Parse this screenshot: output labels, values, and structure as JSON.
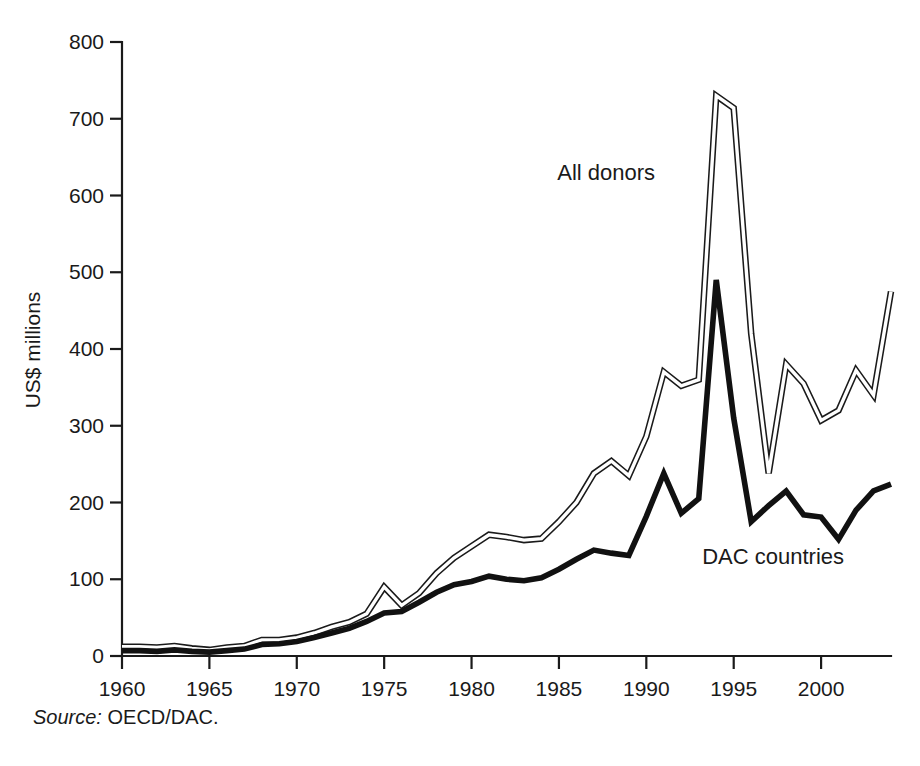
{
  "figure": {
    "source_label": "Source:",
    "source_value": "OECD/DAC.",
    "background_color": "#ffffff",
    "ink_color": "#1a1a1a"
  },
  "chart_data": {
    "type": "line",
    "title": "",
    "subtitle": "",
    "xlabel": "",
    "ylabel": "US$ millions",
    "xlim": [
      1960,
      2004
    ],
    "ylim": [
      0,
      800
    ],
    "ytick_values": [
      0,
      100,
      200,
      300,
      400,
      500,
      600,
      700,
      800
    ],
    "ytick_labels": [
      "0",
      "100",
      "200",
      "300",
      "400",
      "500",
      "600",
      "700",
      "800"
    ],
    "xtick_values": [
      1960,
      1965,
      1970,
      1975,
      1980,
      1985,
      1990,
      1995,
      2000
    ],
    "xtick_labels": [
      "1960",
      "1965",
      "1970",
      "1975",
      "1980",
      "1985",
      "1990",
      "1995",
      "2000"
    ],
    "grid": false,
    "legend": "inline-annotations",
    "x": [
      1960,
      1961,
      1962,
      1963,
      1964,
      1965,
      1966,
      1967,
      1968,
      1969,
      1970,
      1971,
      1972,
      1973,
      1974,
      1975,
      1976,
      1977,
      1978,
      1979,
      1980,
      1981,
      1982,
      1983,
      1984,
      1985,
      1986,
      1987,
      1988,
      1989,
      1990,
      1991,
      1992,
      1993,
      1994,
      1995,
      1996,
      1997,
      1998,
      1999,
      2000,
      2001,
      2002,
      2003,
      2004
    ],
    "series": [
      {
        "name": "All donors",
        "style": "double-line-outline",
        "annotation": "All donors",
        "annotation_x": 1990.5,
        "annotation_y": 620,
        "values": [
          12,
          12,
          11,
          13,
          10,
          8,
          11,
          13,
          21,
          21,
          24,
          30,
          38,
          44,
          55,
          90,
          66,
          82,
          108,
          128,
          143,
          158,
          155,
          151,
          153,
          175,
          200,
          238,
          254,
          235,
          286,
          370,
          352,
          360,
          730,
          714,
          420,
          238,
          380,
          355,
          307,
          320,
          372,
          340,
          475
        ]
      },
      {
        "name": "DAC countries",
        "style": "solid-thick",
        "annotation": "DAC countries",
        "annotation_x": 1993.2,
        "annotation_y": 120,
        "values": [
          7,
          7,
          6,
          8,
          6,
          5,
          7,
          9,
          15,
          16,
          19,
          24,
          30,
          36,
          45,
          56,
          58,
          70,
          83,
          93,
          97,
          104,
          100,
          98,
          102,
          113,
          126,
          138,
          134,
          131,
          182,
          238,
          186,
          205,
          490,
          310,
          175,
          196,
          215,
          184,
          181,
          152,
          190,
          215,
          224
        ]
      }
    ]
  },
  "annotations": [
    {
      "name": "all-donors-label",
      "text": "All donors"
    },
    {
      "name": "dac-countries-label",
      "text": "DAC countries"
    }
  ]
}
